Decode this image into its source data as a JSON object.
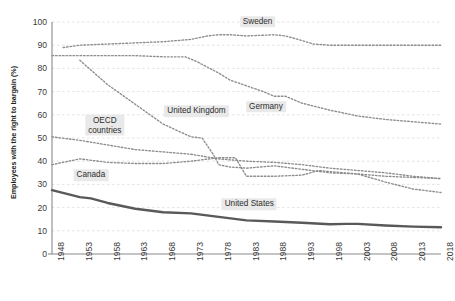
{
  "chart_data": {
    "type": "line",
    "title": "",
    "subtitle": "",
    "xlabel": "",
    "ylabel": "Employees with the right to bargain (%)",
    "xlim": [
      1948,
      2018
    ],
    "ylim": [
      0,
      100
    ],
    "grid": true,
    "legend_position": "inline-labels",
    "y_ticks": [
      0,
      10,
      20,
      30,
      40,
      50,
      60,
      70,
      80,
      90,
      100
    ],
    "x_ticks": [
      1948,
      1953,
      1958,
      1963,
      1968,
      1973,
      1978,
      1983,
      1988,
      1993,
      1998,
      2003,
      2008,
      2013,
      2018
    ],
    "colors": {
      "united_states": "#58595b",
      "dotted_series": "#8c8c8c",
      "gridline": "#dcdcdc",
      "axis": "#8a8a8a",
      "label_background": "#e9e9e9",
      "text": "#3b3b3b"
    },
    "series": [
      {
        "name": "Sweden",
        "style": "dotted",
        "x": [
          1950,
          1953,
          1958,
          1963,
          1968,
          1973,
          1976,
          1978,
          1980,
          1983,
          1988,
          1990,
          1993,
          1995,
          1998,
          2003,
          2008,
          2013,
          2018
        ],
        "values": [
          89,
          90,
          90.5,
          91,
          91.5,
          92.5,
          94,
          94.5,
          94.5,
          94,
          94.5,
          94,
          92,
          90.5,
          90,
          90,
          90,
          90,
          90
        ]
      },
      {
        "name": "Germany",
        "style": "dotted",
        "x": [
          1948,
          1953,
          1958,
          1963,
          1968,
          1972,
          1974,
          1978,
          1980,
          1983,
          1986,
          1988,
          1990,
          1993,
          1998,
          2003,
          2008,
          2013,
          2018
        ],
        "values": [
          85.5,
          85.5,
          85.5,
          85.5,
          85,
          85,
          83,
          78,
          75,
          72.5,
          70,
          68,
          68,
          65,
          62,
          59.5,
          58,
          57,
          56
        ]
      },
      {
        "name": "United Kingdom",
        "style": "dotted",
        "x": [
          1953,
          1958,
          1963,
          1968,
          1973,
          1975,
          1977,
          1978,
          1980,
          1983,
          1988,
          1993,
          1998,
          2003,
          2008,
          2013,
          2018
        ],
        "values": [
          83.5,
          73,
          64.5,
          56,
          50.5,
          50,
          43,
          38.5,
          37.5,
          37,
          38,
          36.5,
          35,
          34.5,
          31,
          28,
          26.5
        ]
      },
      {
        "name": "OECD countries",
        "style": "dotted",
        "x": [
          1948,
          1953,
          1958,
          1963,
          1968,
          1973,
          1978,
          1983,
          1988,
          1993,
          1998,
          2003,
          2008,
          2013,
          2018
        ],
        "values": [
          50.5,
          49,
          47,
          45,
          44,
          43,
          41,
          40,
          39.5,
          38.5,
          37,
          36,
          35,
          33.5,
          32.5
        ]
      },
      {
        "name": "Canada",
        "style": "dotted",
        "x": [
          1948,
          1953,
          1958,
          1963,
          1968,
          1973,
          1978,
          1981,
          1983,
          1988,
          1993,
          1996,
          1998,
          2003,
          2008,
          2013,
          2018
        ],
        "values": [
          38.5,
          41,
          39.5,
          39,
          39,
          40,
          41.5,
          41.5,
          33.5,
          33.5,
          34,
          36,
          35.5,
          34.5,
          33.5,
          33,
          32.5
        ]
      },
      {
        "name": "United States",
        "style": "solid-thick",
        "x": [
          1948,
          1953,
          1955,
          1958,
          1963,
          1968,
          1973,
          1978,
          1983,
          1988,
          1993,
          1998,
          2001,
          2003,
          2008,
          2013,
          2018
        ],
        "values": [
          27.5,
          24.5,
          24,
          22,
          19.5,
          18,
          17.5,
          16,
          14.5,
          14,
          13.5,
          12.8,
          13,
          13,
          12.3,
          11.8,
          11.5
        ]
      }
    ],
    "annotations": [
      {
        "text": "Sweden",
        "x": 1985,
        "y": 100,
        "series": "Sweden"
      },
      {
        "text": "Germany",
        "x": 1986.5,
        "y": 63.5,
        "series": "Germany"
      },
      {
        "text": "United Kingdom",
        "x": 1974,
        "y": 61.5,
        "series": "United Kingdom"
      },
      {
        "text": "OECD\ncountries",
        "x": 1957.5,
        "y": 55.5,
        "series": "OECD countries"
      },
      {
        "text": "Canada",
        "x": 1955,
        "y": 34,
        "series": "Canada"
      },
      {
        "text": "United States",
        "x": 1983.5,
        "y": 21.5,
        "series": "United States"
      }
    ]
  }
}
